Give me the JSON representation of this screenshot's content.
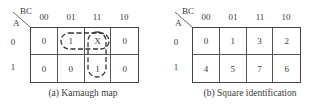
{
  "maps": [
    {
      "id": "a",
      "caption": "(a) Karnaugh map",
      "row_var": "A",
      "col_var": "BC",
      "col_labels": [
        "00",
        "01",
        "11",
        "10"
      ],
      "row_labels": [
        "0",
        "1"
      ],
      "cells": [
        [
          "0",
          "1",
          "X",
          "0"
        ],
        [
          "0",
          "0",
          "1",
          "0"
        ]
      ],
      "groupings": [
        {
          "cells": [
            [
              0,
              1
            ],
            [
              0,
              2
            ]
          ],
          "style": "dashed",
          "description": "horizontal pair m1, m3(X)"
        },
        {
          "cells": [
            [
              0,
              2
            ],
            [
              1,
              2
            ]
          ],
          "style": "dashed",
          "description": "vertical pair m3(X), m7"
        }
      ]
    },
    {
      "id": "b",
      "caption": "(b) Square identification",
      "row_var": "A",
      "col_var": "BC",
      "col_labels": [
        "00",
        "01",
        "11",
        "10"
      ],
      "row_labels": [
        "0",
        "1"
      ],
      "cells": [
        [
          "0",
          "1",
          "3",
          "2"
        ],
        [
          "4",
          "5",
          "7",
          "6"
        ]
      ]
    }
  ],
  "colors": {
    "line": "#444444",
    "text": "#3a3a3a",
    "background": "#ffffff"
  }
}
